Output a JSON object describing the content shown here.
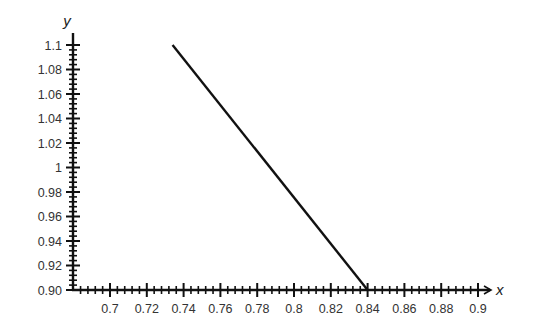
{
  "chart_data": {
    "type": "line",
    "title": "",
    "xlabel": "x",
    "ylabel": "y",
    "xlim": [
      0.68,
      0.91
    ],
    "ylim": [
      0.9,
      1.1
    ],
    "grid": false,
    "legend": null,
    "x_ticks": [
      "0.7",
      "0.72",
      "0.74",
      "0.76",
      "0.78",
      "0.8",
      "0.82",
      "0.84",
      "0.86",
      "0.88",
      "0.9"
    ],
    "y_ticks": [
      "0.90",
      "0.92",
      "0.94",
      "0.96",
      "0.98",
      "1",
      "1.02",
      "1.04",
      "1.06",
      "1.08",
      "1.1"
    ],
    "series": [
      {
        "name": "line",
        "color": "#111111",
        "points": [
          {
            "x": 0.734,
            "y": 1.1
          },
          {
            "x": 0.84,
            "y": 0.9
          }
        ]
      }
    ]
  }
}
